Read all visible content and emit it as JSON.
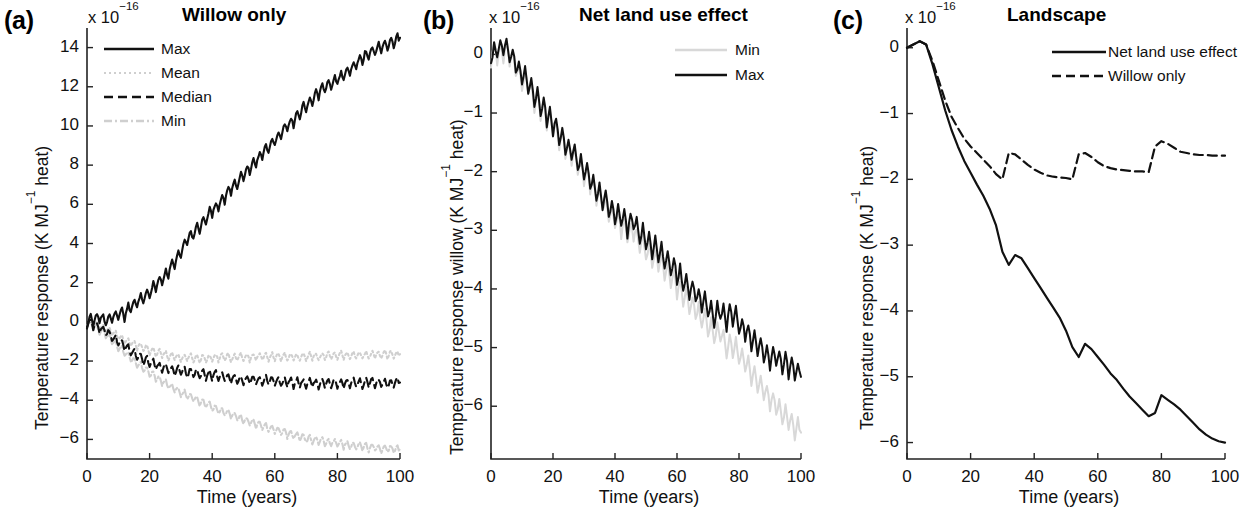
{
  "figure": {
    "caption_letters": [
      "(a)",
      "(b)",
      "(c)"
    ],
    "exponent_prefix": "x 10",
    "exponent_value": "−16",
    "x_axis_label": "Time (years)",
    "x_ticks": [
      "0",
      "20",
      "40",
      "60",
      "80",
      "100"
    ],
    "colors": {
      "primary": "#111111",
      "light": "#cfcfcf",
      "axis": "#222222",
      "background": "#ffffff"
    }
  },
  "panels": [
    {
      "letter": "(a)",
      "title": "Willow  only",
      "ylabel_main": "Temperature response (K MJ",
      "ylabel_sup": "−1",
      "ylabel_tail": " heat)",
      "y_ticks": [
        "14",
        "12",
        "10",
        "8",
        "6",
        "4",
        "2",
        "0",
        "−2",
        "−4",
        "−6"
      ],
      "legend": [
        {
          "label": "Max",
          "style": "solid",
          "color": "#111111"
        },
        {
          "label": "Mean",
          "style": "dotted",
          "color": "#cfcfcf"
        },
        {
          "label": "Median",
          "style": "dashed",
          "color": "#111111"
        },
        {
          "label": "Min",
          "style": "dashdot",
          "color": "#cfcfcf"
        }
      ]
    },
    {
      "letter": "(b)",
      "title": "Net land use effect",
      "ylabel_main": "Temperature response willow (K MJ",
      "ylabel_sup": "−1",
      "ylabel_tail": " heat)",
      "y_ticks": [
        "0",
        "−1",
        "−2",
        "−3",
        "−4",
        "−5",
        "−6"
      ],
      "legend": [
        {
          "label": "Min",
          "style": "solid",
          "color": "#d8d8d8"
        },
        {
          "label": "Max",
          "style": "solid",
          "color": "#111111"
        }
      ]
    },
    {
      "letter": "(c)",
      "title": "Landscape",
      "ylabel_main": "Temperature response (K MJ",
      "ylabel_sup": "−1",
      "ylabel_tail": " heat)",
      "y_ticks": [
        "0",
        "−1",
        "−2",
        "−3",
        "−4",
        "−5",
        "−6"
      ],
      "legend": [
        {
          "label": "Net land use effect",
          "style": "solid",
          "color": "#111111"
        },
        {
          "label": "Willow only",
          "style": "dashed",
          "color": "#111111"
        }
      ]
    }
  ],
  "chart_data": [
    {
      "type": "line",
      "panel": "(a)",
      "title": "Willow  only",
      "xlabel": "Time (years)",
      "ylabel": "Temperature response (K MJ−1 heat)",
      "y_scale_exponent": -16,
      "xlim": [
        0,
        100
      ],
      "ylim": [
        -7,
        15
      ],
      "xticks": [
        0,
        20,
        40,
        60,
        80,
        100
      ],
      "yticks": [
        -6,
        -4,
        -2,
        0,
        2,
        4,
        6,
        8,
        10,
        12,
        14
      ],
      "grid": false,
      "legend_position": "upper-left-inside",
      "x": [
        0,
        2,
        4,
        6,
        8,
        10,
        12,
        14,
        16,
        18,
        20,
        22,
        24,
        26,
        28,
        30,
        32,
        34,
        36,
        38,
        40,
        42,
        44,
        46,
        48,
        50,
        52,
        54,
        56,
        58,
        60,
        62,
        64,
        66,
        68,
        70,
        72,
        74,
        76,
        78,
        80,
        82,
        84,
        86,
        88,
        90,
        92,
        94,
        96,
        98,
        100
      ],
      "series": [
        {
          "name": "Max",
          "style": "solid",
          "color": "#111111",
          "values": [
            0,
            0.15,
            0.25,
            0.1,
            0.2,
            0.45,
            0.4,
            0.8,
            1.0,
            1.3,
            1.5,
            1.9,
            2.2,
            2.6,
            3.0,
            3.6,
            4.2,
            4.5,
            4.9,
            5.3,
            5.7,
            6.0,
            6.4,
            6.8,
            7.1,
            7.5,
            7.9,
            8.2,
            8.6,
            8.9,
            9.3,
            9.6,
            10.0,
            10.3,
            10.7,
            11.0,
            11.4,
            11.7,
            12.0,
            12.2,
            12.4,
            12.6,
            12.9,
            13.2,
            13.5,
            13.7,
            13.9,
            14.1,
            14.2,
            14.3,
            14.5
          ]
        },
        {
          "name": "Mean",
          "style": "dotted",
          "color": "#cfcfcf",
          "values": [
            0,
            -0.1,
            -0.2,
            -0.35,
            -0.5,
            -0.7,
            -0.9,
            -1.05,
            -1.2,
            -1.3,
            -1.45,
            -1.55,
            -1.6,
            -1.7,
            -1.75,
            -1.8,
            -1.8,
            -1.85,
            -1.85,
            -1.85,
            -1.85,
            -1.8,
            -1.8,
            -1.8,
            -1.8,
            -1.8,
            -1.8,
            -1.8,
            -1.75,
            -1.8,
            -1.75,
            -1.75,
            -1.8,
            -1.8,
            -1.8,
            -1.75,
            -1.75,
            -1.75,
            -1.7,
            -1.7,
            -1.7,
            -1.7,
            -1.7,
            -1.7,
            -1.7,
            -1.7,
            -1.65,
            -1.7,
            -1.65,
            -1.65,
            -1.65
          ]
        },
        {
          "name": "Median",
          "style": "dashed",
          "color": "#111111",
          "values": [
            0,
            -0.15,
            -0.3,
            -0.5,
            -0.75,
            -1.0,
            -1.25,
            -1.5,
            -1.7,
            -1.9,
            -2.05,
            -2.2,
            -2.3,
            -2.4,
            -2.45,
            -2.5,
            -2.55,
            -2.6,
            -2.65,
            -2.7,
            -2.7,
            -2.75,
            -2.8,
            -2.85,
            -2.9,
            -2.95,
            -2.95,
            -3.0,
            -2.95,
            -3.0,
            -3.0,
            -3.05,
            -3.05,
            -3.1,
            -3.1,
            -3.1,
            -3.1,
            -3.15,
            -3.1,
            -3.1,
            -3.15,
            -3.1,
            -3.1,
            -3.1,
            -3.15,
            -3.1,
            -3.1,
            -3.1,
            -3.15,
            -3.1,
            -3.1
          ]
        },
        {
          "name": "Min",
          "style": "dashdot",
          "color": "#cfcfcf",
          "values": [
            0,
            -0.2,
            -0.4,
            -0.65,
            -0.95,
            -1.25,
            -1.55,
            -1.85,
            -2.1,
            -2.35,
            -2.6,
            -2.8,
            -3.0,
            -3.2,
            -3.4,
            -3.6,
            -3.75,
            -3.9,
            -4.05,
            -4.2,
            -4.35,
            -4.5,
            -4.6,
            -4.75,
            -4.85,
            -5.0,
            -5.1,
            -5.2,
            -5.3,
            -5.4,
            -5.5,
            -5.6,
            -5.7,
            -5.8,
            -5.85,
            -5.95,
            -6.0,
            -6.05,
            -6.1,
            -6.15,
            -6.2,
            -6.25,
            -6.3,
            -6.3,
            -6.35,
            -6.4,
            -6.4,
            -6.45,
            -6.45,
            -6.5,
            -6.5
          ]
        }
      ]
    },
    {
      "type": "line",
      "panel": "(b)",
      "title": "Net land use effect",
      "xlabel": "Time (years)",
      "ylabel": "Temperature response willow (K MJ−1 heat)",
      "y_scale_exponent": -16,
      "xlim": [
        0,
        100
      ],
      "ylim": [
        -6.9,
        0.45
      ],
      "xticks": [
        0,
        20,
        40,
        60,
        80,
        100
      ],
      "yticks": [
        -6,
        -5,
        -4,
        -3,
        -2,
        -1,
        0
      ],
      "grid": false,
      "legend_position": "upper-right-inside",
      "x": [
        0,
        2,
        4,
        6,
        8,
        10,
        12,
        14,
        16,
        18,
        20,
        22,
        24,
        26,
        28,
        30,
        32,
        34,
        36,
        38,
        40,
        42,
        44,
        46,
        48,
        50,
        52,
        54,
        56,
        58,
        60,
        62,
        64,
        66,
        68,
        70,
        72,
        74,
        76,
        78,
        80,
        82,
        84,
        86,
        88,
        90,
        92,
        94,
        96,
        98,
        100
      ],
      "series": [
        {
          "name": "Max",
          "style": "solid",
          "color": "#111111",
          "values": [
            0,
            0.1,
            0.15,
            0.05,
            -0.15,
            -0.35,
            -0.45,
            -0.7,
            -0.85,
            -1.0,
            -1.15,
            -1.35,
            -1.5,
            -1.65,
            -1.8,
            -1.95,
            -2.1,
            -2.3,
            -2.45,
            -2.6,
            -2.7,
            -2.75,
            -2.95,
            -2.8,
            -3.05,
            -3.1,
            -3.25,
            -3.35,
            -3.45,
            -3.55,
            -3.7,
            -3.85,
            -3.95,
            -4.05,
            -4.2,
            -4.3,
            -4.45,
            -4.35,
            -4.5,
            -4.4,
            -4.6,
            -4.7,
            -4.85,
            -4.95,
            -5.05,
            -5.15,
            -5.15,
            -5.25,
            -5.3,
            -5.4,
            -5.5
          ]
        },
        {
          "name": "Min",
          "style": "solid",
          "color": "#d8d8d8",
          "values": [
            0,
            0.05,
            0.1,
            0.0,
            -0.2,
            -0.4,
            -0.5,
            -0.75,
            -0.9,
            -1.05,
            -1.2,
            -1.4,
            -1.55,
            -1.7,
            -1.85,
            -2.0,
            -2.15,
            -2.35,
            -2.5,
            -2.65,
            -2.8,
            -2.9,
            -3.05,
            -3.0,
            -3.2,
            -3.3,
            -3.45,
            -3.55,
            -3.65,
            -3.8,
            -3.95,
            -4.1,
            -4.25,
            -4.35,
            -4.5,
            -4.6,
            -4.75,
            -4.75,
            -4.95,
            -4.95,
            -5.1,
            -5.25,
            -5.4,
            -5.55,
            -5.7,
            -5.85,
            -5.95,
            -6.1,
            -6.2,
            -6.35,
            -6.45
          ]
        }
      ]
    },
    {
      "type": "line",
      "panel": "(c)",
      "title": "Landscape",
      "xlabel": "Time (years)",
      "ylabel": "Temperature response (K MJ−1 heat)",
      "y_scale_exponent": -16,
      "xlim": [
        0,
        100
      ],
      "ylim": [
        -6.25,
        0.3
      ],
      "xticks": [
        0,
        20,
        40,
        60,
        80,
        100
      ],
      "yticks": [
        -6,
        -5,
        -4,
        -3,
        -2,
        -1,
        0
      ],
      "grid": false,
      "legend_position": "upper-right-inside",
      "x": [
        0,
        2,
        4,
        6,
        8,
        10,
        12,
        14,
        16,
        18,
        20,
        22,
        24,
        26,
        28,
        30,
        32,
        34,
        36,
        38,
        40,
        42,
        44,
        46,
        48,
        50,
        52,
        54,
        56,
        58,
        60,
        62,
        64,
        66,
        68,
        70,
        72,
        74,
        76,
        78,
        80,
        82,
        84,
        86,
        88,
        90,
        92,
        94,
        96,
        98,
        100
      ],
      "series": [
        {
          "name": "Net land use effect",
          "style": "solid",
          "color": "#111111",
          "values": [
            0,
            0.05,
            0.1,
            0.05,
            -0.25,
            -0.6,
            -0.95,
            -1.25,
            -1.5,
            -1.72,
            -1.9,
            -2.08,
            -2.25,
            -2.45,
            -2.7,
            -3.1,
            -3.3,
            -3.15,
            -3.2,
            -3.35,
            -3.5,
            -3.65,
            -3.8,
            -3.95,
            -4.1,
            -4.3,
            -4.55,
            -4.7,
            -4.5,
            -4.58,
            -4.7,
            -4.82,
            -4.95,
            -5.05,
            -5.18,
            -5.3,
            -5.4,
            -5.5,
            -5.6,
            -5.55,
            -5.28,
            -5.35,
            -5.42,
            -5.5,
            -5.6,
            -5.7,
            -5.8,
            -5.88,
            -5.94,
            -5.98,
            -6.0
          ]
        },
        {
          "name": "Willow only",
          "style": "dashed",
          "color": "#111111",
          "values": [
            0,
            0.05,
            0.1,
            0.05,
            -0.2,
            -0.5,
            -0.8,
            -1.05,
            -1.22,
            -1.38,
            -1.5,
            -1.6,
            -1.7,
            -1.8,
            -1.92,
            -2.0,
            -1.6,
            -1.62,
            -1.7,
            -1.78,
            -1.85,
            -1.9,
            -1.94,
            -1.96,
            -1.97,
            -1.98,
            -2.0,
            -1.62,
            -1.6,
            -1.66,
            -1.74,
            -1.8,
            -1.83,
            -1.85,
            -1.86,
            -1.87,
            -1.88,
            -1.88,
            -1.89,
            -1.5,
            -1.42,
            -1.46,
            -1.52,
            -1.58,
            -1.6,
            -1.62,
            -1.63,
            -1.63,
            -1.64,
            -1.64,
            -1.64
          ]
        }
      ]
    }
  ]
}
